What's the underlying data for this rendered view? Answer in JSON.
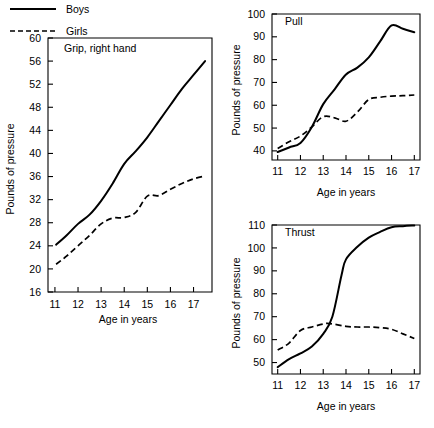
{
  "figure": {
    "background": "#ffffff",
    "ink": "#000000"
  },
  "legend": {
    "name": "series-legend",
    "entries": [
      {
        "label": "Boys",
        "style": "solid"
      },
      {
        "label": "Girls",
        "style": "dashed"
      }
    ]
  },
  "chart_data": [
    {
      "type": "line",
      "id": "grip",
      "title": "Grip, right hand",
      "xlabel": "Age in years",
      "ylabel": "Pounds of pressure",
      "xlim": [
        10.7,
        17.8
      ],
      "ylim": [
        16,
        60
      ],
      "xticks": [
        11,
        12,
        13,
        14,
        15,
        16,
        17
      ],
      "yticks": [
        16,
        20,
        24,
        28,
        32,
        36,
        40,
        44,
        48,
        52,
        56,
        60
      ],
      "xticklabels": [
        "11",
        "12",
        "13",
        "14",
        "15",
        "16",
        "17"
      ],
      "yticklabels": [
        "16",
        "20",
        "24",
        "28",
        "32",
        "36",
        "40",
        "44",
        "48",
        "52",
        "56",
        "60"
      ],
      "grid": false,
      "legend_position": "below-figure",
      "series": [
        {
          "name": "Boys",
          "style": "solid",
          "x": [
            11.05,
            11.5,
            12.0,
            12.5,
            13.0,
            13.5,
            14.0,
            14.5,
            15.0,
            15.5,
            16.0,
            16.5,
            17.0,
            17.5
          ],
          "values": [
            24.2,
            25.8,
            27.8,
            29.4,
            31.8,
            34.8,
            38.2,
            40.4,
            42.8,
            45.6,
            48.4,
            51.2,
            53.6,
            56.0
          ]
        },
        {
          "name": "Girls",
          "style": "dashed",
          "x": [
            11.05,
            11.5,
            12.0,
            12.5,
            13.0,
            13.5,
            14.0,
            14.5,
            15.0,
            15.5,
            16.0,
            16.5,
            17.0,
            17.5
          ],
          "values": [
            20.8,
            22.2,
            24.0,
            25.8,
            27.8,
            28.8,
            28.9,
            29.8,
            32.6,
            32.7,
            33.8,
            34.8,
            35.6,
            36.1
          ]
        }
      ]
    },
    {
      "type": "line",
      "id": "pull",
      "title": "Pull",
      "xlabel": "Age in years",
      "ylabel": "Pounds of pressure",
      "xlim": [
        10.75,
        17.25
      ],
      "ylim": [
        36,
        100
      ],
      "xticks": [
        11,
        12,
        13,
        14,
        15,
        16,
        17
      ],
      "yticks": [
        40,
        50,
        60,
        70,
        80,
        90,
        100
      ],
      "xticklabels": [
        "11",
        "12",
        "13",
        "14",
        "15",
        "16",
        "17"
      ],
      "yticklabels": [
        "40",
        "50",
        "60",
        "70",
        "80",
        "90",
        "100"
      ],
      "grid": false,
      "legend_position": "shared",
      "series": [
        {
          "name": "Boys",
          "style": "solid",
          "x": [
            11.0,
            11.5,
            12.0,
            12.5,
            13.0,
            13.5,
            14.0,
            14.5,
            15.0,
            15.5,
            16.0,
            16.5,
            17.0
          ],
          "values": [
            39.5,
            41.5,
            43.5,
            50.5,
            60.5,
            67.0,
            73.5,
            76.5,
            81.0,
            88.0,
            95.0,
            93.5,
            92.0
          ]
        },
        {
          "name": "Girls",
          "style": "dashed",
          "x": [
            11.0,
            11.5,
            12.0,
            12.5,
            13.0,
            13.5,
            14.0,
            14.5,
            15.0,
            15.5,
            16.0,
            16.5,
            17.0
          ],
          "values": [
            41.0,
            44.0,
            46.5,
            50.5,
            55.0,
            54.5,
            53.0,
            57.0,
            62.5,
            63.5,
            64.0,
            64.2,
            64.5
          ]
        }
      ]
    },
    {
      "type": "line",
      "id": "thrust",
      "title": "Thrust",
      "xlabel": "Age in years",
      "ylabel": "Pounds of pressure",
      "xlim": [
        10.75,
        17.25
      ],
      "ylim": [
        45,
        110
      ],
      "xticks": [
        11,
        12,
        13,
        14,
        15,
        16,
        17
      ],
      "yticks": [
        50,
        60,
        70,
        80,
        90,
        100,
        110
      ],
      "xticklabels": [
        "11",
        "12",
        "13",
        "14",
        "15",
        "16",
        "17"
      ],
      "yticklabels": [
        "50",
        "60",
        "70",
        "80",
        "90",
        "100",
        "110"
      ],
      "grid": false,
      "legend_position": "shared",
      "series": [
        {
          "name": "Boys",
          "style": "solid",
          "x": [
            11.0,
            11.5,
            12.0,
            12.5,
            13.0,
            13.4,
            13.8,
            14.0,
            14.5,
            15.0,
            15.5,
            16.0,
            16.5,
            17.0
          ],
          "values": [
            48.0,
            51.5,
            54.0,
            57.0,
            62.5,
            70.0,
            88.0,
            95.0,
            100.5,
            104.5,
            107.0,
            109.0,
            109.5,
            109.8
          ]
        },
        {
          "name": "Girls",
          "style": "dashed",
          "x": [
            11.0,
            11.5,
            12.0,
            12.5,
            13.0,
            13.3,
            14.0,
            14.5,
            15.0,
            15.5,
            16.0,
            16.5,
            17.0
          ],
          "values": [
            55.5,
            58.5,
            64.0,
            65.5,
            66.8,
            67.0,
            65.8,
            65.5,
            65.5,
            65.2,
            64.5,
            62.5,
            60.5
          ]
        }
      ]
    }
  ]
}
